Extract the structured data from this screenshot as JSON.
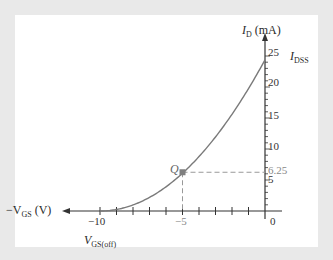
{
  "chart_data": {
    "type": "line",
    "title": "",
    "xlabel": "-V_GS (V)",
    "ylabel": "I_D (mA)",
    "xlim": [
      -10,
      0
    ],
    "ylim": [
      0,
      25
    ],
    "x_ticks": [
      -10,
      -5,
      0
    ],
    "y_ticks": [
      5,
      10,
      15,
      20,
      25
    ],
    "grid": false,
    "series": [
      {
        "name": "Transfer characteristic",
        "x": [
          -10,
          -9,
          -8,
          -7,
          -6,
          -5,
          -4,
          -3,
          -2,
          -1,
          0
        ],
        "values": [
          0,
          0.25,
          1,
          2.25,
          4,
          6.25,
          9,
          12.25,
          16,
          20.25,
          25
        ]
      }
    ],
    "annotations": [
      {
        "label": "Q",
        "x": -5,
        "y": 6.25
      },
      {
        "label": "6.25",
        "x": 0,
        "y": 6.25
      },
      {
        "label": "I_DSS",
        "x": 0,
        "y": 25
      },
      {
        "label": "V_GS(off)",
        "x": -10,
        "y": 0
      }
    ]
  },
  "labels": {
    "y_axis_main": "I",
    "y_axis_sub": "D",
    "y_axis_unit": " (mA)",
    "x_axis_prefix": "−V",
    "x_axis_sub": "GS",
    "x_axis_unit": " (V)",
    "idss_main": "I",
    "idss_sub": "DSS",
    "vgsoff_main": "V",
    "vgsoff_sub": "GS(off)",
    "q_point": "Q",
    "q_value": "6.25",
    "tick_x_neg10": "−10",
    "tick_x_neg5": "−5",
    "tick_x_0": "0",
    "tick_y_5": "5",
    "tick_y_10": "10",
    "tick_y_15": "15",
    "tick_y_20": "20",
    "tick_y_25": "25"
  },
  "colors": {
    "curve": "#7a7a7a",
    "axis": "#333333",
    "dashed": "#999999",
    "q_marker": "#808080",
    "background": "#e9e9e9",
    "panel": "#ffffff"
  }
}
